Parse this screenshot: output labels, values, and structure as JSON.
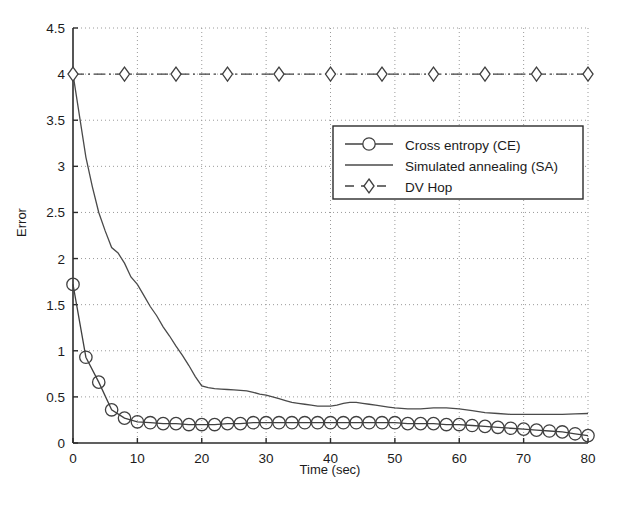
{
  "chart_data": {
    "type": "line",
    "title": "",
    "xlabel": "Time (sec)",
    "ylabel": "Error",
    "xlim": [
      0,
      80
    ],
    "ylim": [
      0,
      4.5
    ],
    "xticks": [
      0,
      10,
      20,
      30,
      40,
      50,
      60,
      70,
      80
    ],
    "xtick_labels": [
      "0",
      "10",
      "20",
      "30",
      "40",
      "50",
      "60",
      "70",
      "80"
    ],
    "yticks": [
      0,
      0.5,
      1,
      1.5,
      2,
      2.5,
      3,
      3.5,
      4,
      4.5
    ],
    "ytick_labels": [
      "0",
      "0.5",
      "1",
      "1.5",
      "2",
      "2.5",
      "3",
      "3.5",
      "4",
      "4.5"
    ],
    "grid": true,
    "grid_style": "dotted",
    "legend_position": "upper-right-inside",
    "series": [
      {
        "name": "Cross entropy (CE)",
        "style": "solid-with-circle-markers",
        "marker": "circle",
        "color": "#404040",
        "x": [
          0,
          2,
          4,
          6,
          8,
          10,
          12,
          14,
          16,
          18,
          20,
          22,
          24,
          26,
          28,
          30,
          32,
          34,
          36,
          38,
          40,
          42,
          44,
          46,
          48,
          50,
          52,
          54,
          56,
          58,
          60,
          62,
          64,
          66,
          68,
          70,
          72,
          74,
          76,
          78,
          80
        ],
        "y": [
          1.72,
          0.93,
          0.66,
          0.36,
          0.27,
          0.23,
          0.22,
          0.21,
          0.21,
          0.2,
          0.2,
          0.2,
          0.21,
          0.21,
          0.22,
          0.22,
          0.22,
          0.22,
          0.22,
          0.22,
          0.22,
          0.22,
          0.22,
          0.22,
          0.22,
          0.22,
          0.21,
          0.21,
          0.21,
          0.2,
          0.2,
          0.19,
          0.18,
          0.17,
          0.16,
          0.15,
          0.14,
          0.13,
          0.12,
          0.1,
          0.08
        ]
      },
      {
        "name": "Simulated annealing (SA)",
        "style": "solid-thin",
        "marker": "none",
        "color": "#4a4a4a",
        "x": [
          0,
          1,
          2,
          3,
          4,
          5,
          6,
          7,
          8,
          9,
          10,
          11,
          12,
          13,
          14,
          15,
          16,
          17,
          18,
          19,
          20,
          21,
          22,
          23,
          24,
          25,
          26,
          27,
          28,
          29,
          30,
          31,
          32,
          33,
          34,
          35,
          36,
          37,
          38,
          39,
          40,
          41,
          42,
          43,
          44,
          45,
          46,
          47,
          48,
          49,
          50,
          52,
          54,
          56,
          58,
          60,
          62,
          64,
          66,
          68,
          70,
          72,
          74,
          76,
          78,
          80
        ],
        "y": [
          4.0,
          3.55,
          3.1,
          2.78,
          2.5,
          2.3,
          2.12,
          2.06,
          1.95,
          1.8,
          1.72,
          1.6,
          1.48,
          1.38,
          1.26,
          1.16,
          1.05,
          0.95,
          0.84,
          0.72,
          0.62,
          0.6,
          0.59,
          0.585,
          0.58,
          0.575,
          0.57,
          0.565,
          0.55,
          0.53,
          0.52,
          0.5,
          0.48,
          0.46,
          0.44,
          0.43,
          0.42,
          0.41,
          0.4,
          0.4,
          0.4,
          0.41,
          0.43,
          0.44,
          0.44,
          0.43,
          0.42,
          0.41,
          0.4,
          0.39,
          0.38,
          0.37,
          0.37,
          0.38,
          0.38,
          0.37,
          0.35,
          0.33,
          0.32,
          0.31,
          0.31,
          0.31,
          0.31,
          0.31,
          0.315,
          0.32
        ]
      },
      {
        "name": "DV Hop",
        "style": "dash-dot-with-diamond-markers",
        "marker": "diamond",
        "color": "#404040",
        "x": [
          0,
          8,
          16,
          24,
          32,
          40,
          48,
          56,
          64,
          72,
          80
        ],
        "y": [
          4.0,
          4.0,
          4.0,
          4.0,
          4.0,
          4.0,
          4.0,
          4.0,
          4.0,
          4.0,
          4.0
        ]
      }
    ]
  },
  "legend": {
    "entries": [
      {
        "label": "Cross entropy (CE)"
      },
      {
        "label": "Simulated annealing (SA)"
      },
      {
        "label": "DV Hop"
      }
    ]
  },
  "colors": {
    "axis": "#2b2b2b",
    "grid": "#9a9a9a",
    "background": "#ffffff",
    "text": "#1b1b1b"
  }
}
